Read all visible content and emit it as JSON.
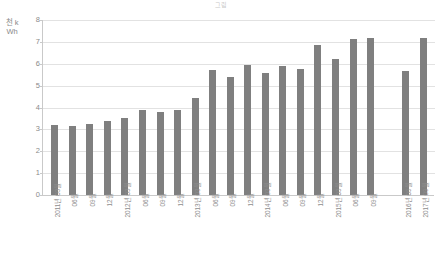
{
  "chart_title": "그림",
  "y_axis_title": "천 kWh",
  "colors": {
    "bar": "#7f7f7f",
    "grid": "#e2e2e2",
    "axis": "#c9c9c9",
    "tick_text": "#8a8a8a",
    "title_text": "#c8c8c8"
  },
  "chart_data": {
    "type": "bar",
    "title": "그림",
    "xlabel": "",
    "ylabel": "천 kWh",
    "ylim": [
      0,
      8
    ],
    "yticks": [
      0,
      1,
      2,
      3,
      4,
      5,
      6,
      7,
      8
    ],
    "ytick_labels": [
      "0",
      "1",
      "2",
      "3",
      "4",
      "5",
      "6",
      "7",
      "8"
    ],
    "grid": true,
    "legend": null,
    "categories": [
      "2011년 03월",
      "06월",
      "09월",
      "12월",
      "2012년 03월",
      "06월",
      "09월",
      "12월",
      "2013년 03월",
      "06월",
      "09월",
      "12월",
      "2014년 03월",
      "06월",
      "09월",
      "12월",
      "2015년 03월",
      "06월",
      "09월",
      "",
      "2016년 09월",
      "2017년 09월"
    ],
    "values": [
      3.2,
      3.15,
      3.25,
      3.4,
      3.5,
      3.9,
      3.8,
      3.9,
      4.45,
      5.7,
      5.4,
      5.95,
      5.6,
      5.9,
      5.75,
      6.85,
      6.2,
      7.15,
      7.2,
      null,
      5.65,
      7.2
    ]
  }
}
